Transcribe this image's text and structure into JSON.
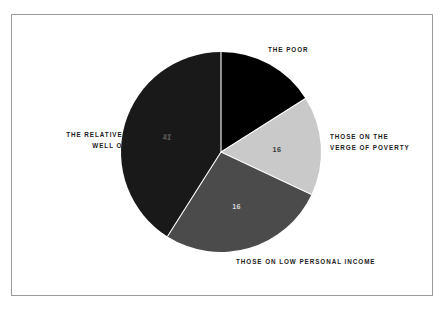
{
  "figure": {
    "background_color": "#ffffff",
    "frame_border_color": "#9a9a9a"
  },
  "chart_data": {
    "type": "pie",
    "title": "",
    "subtitle": "",
    "xlabel": "",
    "ylabel": "",
    "legend_position": "none",
    "grid": false,
    "total": 100,
    "start_angle_deg": 0,
    "direction": "clockwise",
    "categories": [
      "THE POOR",
      "THOSE ON THE\nVERGE OF POVERTY",
      "THOSE ON LOW PERSONAL INCOME",
      "THE RELATIVELY\nWELL OFF"
    ],
    "values": [
      16,
      16,
      27,
      41
    ],
    "value_labels": [
      "16",
      "16",
      "27",
      "41"
    ],
    "colors": [
      "#000000",
      "#c9c9c9",
      "#4b4b4b",
      "#191919"
    ],
    "value_label_colors": [
      "#ffffff",
      "#3a3a3a",
      "#d8d8d8",
      "#555555"
    ],
    "slices": [
      {
        "name": "THE POOR",
        "value": 16,
        "value_label": "16",
        "color": "#000000",
        "label_color": "#ffffff",
        "start_deg": 0,
        "end_deg": 57.6,
        "callout": "THE POOR"
      },
      {
        "name": "THOSE ON THE VERGE OF POVERTY",
        "value": 16,
        "value_label": "16",
        "color": "#c9c9c9",
        "label_color": "#3a3a3a",
        "start_deg": 57.6,
        "end_deg": 115.2,
        "callout": "THOSE ON THE\nVERGE OF POVERTY"
      },
      {
        "name": "THOSE ON LOW PERSONAL INCOME",
        "value": 27,
        "value_label": "27",
        "color": "#4b4b4b",
        "label_color": "#d8d8d8",
        "start_deg": 115.2,
        "end_deg": 212.4,
        "callout": "THOSE ON LOW PERSONAL INCOME"
      },
      {
        "name": "THE RELATIVELY WELL OFF",
        "value": 41,
        "value_label": "41",
        "color": "#191919",
        "label_color": "#555555",
        "start_deg": 212.4,
        "end_deg": 360,
        "callout": "THE RELATIVELY\nWELL OFF"
      }
    ]
  },
  "labels": {
    "the_poor": "THE POOR",
    "verge_of_poverty": "THOSE ON THE\nVERGE OF POVERTY",
    "low_personal_income": "THOSE ON LOW PERSONAL INCOME",
    "relatively_well_off": "THE RELATIVELY\nWELL OFF"
  },
  "values": {
    "the_poor": "16",
    "verge_of_poverty": "16",
    "low_personal_income": "27",
    "relatively_well_off": "41"
  }
}
